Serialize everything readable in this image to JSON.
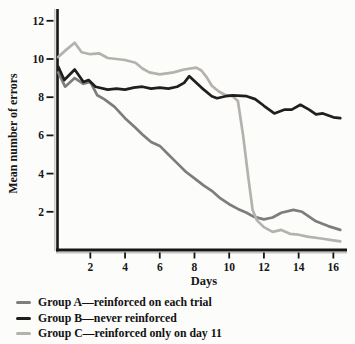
{
  "figure": {
    "background_color": "#fcfcfa"
  },
  "chart_data": {
    "type": "line",
    "title": "",
    "xlabel": "Days",
    "ylabel": "Mean number of errors",
    "x_ticks": [
      2,
      4,
      6,
      8,
      10,
      12,
      14,
      16
    ],
    "y_ticks": [
      2,
      4,
      6,
      8,
      10,
      12
    ],
    "xlim": [
      0,
      16.8
    ],
    "ylim": [
      0,
      12.6
    ],
    "grid": false,
    "legend_position": "below-chart",
    "axis_color": "#161616",
    "axis_shadow_color": "#c6c4c0",
    "series": [
      {
        "id": "group-a",
        "name": "Group A—reinforced on each trial",
        "color": "#7f7d7b",
        "x": [
          0.15,
          0.55,
          1.1,
          1.6,
          2.0,
          2.4,
          2.8,
          3.4,
          4.0,
          4.6,
          5.0,
          5.5,
          6.0,
          6.5,
          7.0,
          7.5,
          8.0,
          8.5,
          9.0,
          9.5,
          10.0,
          10.5,
          11.0,
          11.4,
          12.0,
          12.5,
          13.0,
          13.7,
          14.2,
          15.0,
          15.7,
          16.4
        ],
        "values": [
          9.3,
          8.55,
          9.0,
          8.7,
          8.8,
          8.1,
          7.9,
          7.5,
          6.9,
          6.4,
          6.05,
          5.65,
          5.45,
          5.0,
          4.55,
          4.1,
          3.75,
          3.4,
          3.1,
          2.7,
          2.4,
          2.15,
          1.95,
          1.75,
          1.6,
          1.7,
          1.95,
          2.1,
          2.0,
          1.5,
          1.25,
          1.05
        ]
      },
      {
        "id": "group-b",
        "name": "Group B—never reinforced",
        "color": "#211e1e",
        "x": [
          0.15,
          0.5,
          1.1,
          1.6,
          1.9,
          2.3,
          3.0,
          3.5,
          4.0,
          4.5,
          5.0,
          5.5,
          6.0,
          6.5,
          7.0,
          7.4,
          7.7,
          8.4,
          9.0,
          9.3,
          9.8,
          10.2,
          11.0,
          11.5,
          12.0,
          12.6,
          13.2,
          13.6,
          14.1,
          14.6,
          15.0,
          15.4,
          16.0,
          16.4
        ],
        "values": [
          9.6,
          8.9,
          9.45,
          8.8,
          8.9,
          8.55,
          8.4,
          8.45,
          8.4,
          8.5,
          8.55,
          8.45,
          8.5,
          8.45,
          8.55,
          8.75,
          9.1,
          8.5,
          8.05,
          7.95,
          8.05,
          8.1,
          8.05,
          7.9,
          7.55,
          7.15,
          7.35,
          7.35,
          7.6,
          7.35,
          7.1,
          7.15,
          6.95,
          6.9
        ]
      },
      {
        "id": "group-c",
        "name": "Group C—reinforced only on day 11",
        "color": "#b5b2ae",
        "x": [
          0.15,
          0.5,
          1.1,
          1.5,
          2.0,
          2.5,
          3.0,
          4.0,
          4.6,
          5.0,
          5.4,
          6.0,
          6.8,
          7.4,
          8.1,
          8.4,
          8.7,
          9.0,
          9.4,
          9.8,
          10.2,
          10.5,
          10.8,
          11.1,
          11.35,
          11.6,
          12.0,
          12.5,
          13.0,
          13.5,
          14.0,
          14.5,
          15.3,
          16.0,
          16.4
        ],
        "values": [
          10.1,
          10.4,
          10.85,
          10.35,
          10.25,
          10.3,
          10.05,
          9.95,
          9.8,
          9.5,
          9.3,
          9.2,
          9.3,
          9.45,
          9.55,
          9.4,
          9.05,
          8.6,
          8.3,
          8.1,
          8.05,
          7.8,
          6.0,
          3.8,
          2.1,
          1.55,
          1.2,
          0.95,
          1.05,
          0.85,
          0.8,
          0.7,
          0.6,
          0.5,
          0.45
        ]
      }
    ]
  }
}
